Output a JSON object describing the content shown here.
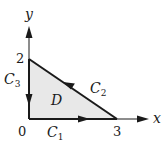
{
  "diagram": {
    "axes": {
      "x_label": "x",
      "y_label": "y",
      "origin_label": "0",
      "x_tick_label": "3",
      "y_tick_label": "2"
    },
    "region": {
      "label": "D",
      "fill_color": "#e8e8e8",
      "vertices": [
        [
          0,
          0
        ],
        [
          3,
          0
        ],
        [
          0,
          2
        ]
      ]
    },
    "curves": [
      {
        "name": "C",
        "subscript": "1",
        "from": [
          0,
          0
        ],
        "to": [
          3,
          0
        ],
        "direction": "right"
      },
      {
        "name": "C",
        "subscript": "2",
        "from": [
          3,
          0
        ],
        "to": [
          0,
          2
        ],
        "direction": "up-left"
      },
      {
        "name": "C",
        "subscript": "3",
        "from": [
          0,
          2
        ],
        "to": [
          0,
          0
        ],
        "direction": "down"
      }
    ],
    "colors": {
      "stroke": "#1a1a1a",
      "fill": "#e8e8e8",
      "background": "#ffffff"
    }
  }
}
